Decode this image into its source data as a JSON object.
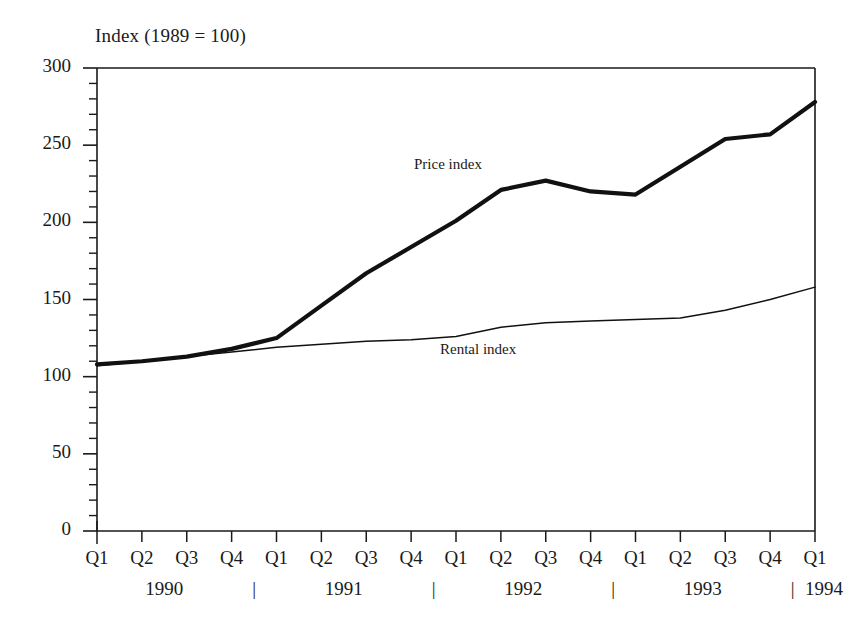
{
  "chart_data": {
    "type": "line",
    "title": "Index (1989 = 100)",
    "xlabel": "",
    "ylabel": "",
    "ylim": [
      0,
      300
    ],
    "y_ticks": [
      0,
      50,
      100,
      150,
      200,
      250,
      300
    ],
    "y_minor_step": 10,
    "grid": false,
    "legend_position": "inline-annotation",
    "categories": [
      "Q1 1990",
      "Q2 1990",
      "Q3 1990",
      "Q4 1990",
      "Q1 1991",
      "Q2 1991",
      "Q3 1991",
      "Q4 1991",
      "Q1 1992",
      "Q2 1992",
      "Q3 1992",
      "Q4 1992",
      "Q1 1993",
      "Q2 1993",
      "Q3 1993",
      "Q4 1993",
      "Q1 1994"
    ],
    "quarter_labels": [
      "Q1",
      "Q2",
      "Q3",
      "Q4",
      "Q1",
      "Q2",
      "Q3",
      "Q4",
      "Q1",
      "Q2",
      "Q3",
      "Q4",
      "Q1",
      "Q2",
      "Q3",
      "Q4",
      "Q1"
    ],
    "year_labels": [
      "1990",
      "1991",
      "1992",
      "1993",
      "1994"
    ],
    "year_separator_glyph": "|",
    "series": [
      {
        "name": "Price index",
        "values": [
          108,
          110,
          113,
          118,
          125,
          146,
          167,
          184,
          201,
          221,
          227,
          220,
          218,
          236,
          254,
          257,
          278
        ]
      },
      {
        "name": "Rental index",
        "values": [
          107,
          110,
          113,
          116,
          119,
          121,
          123,
          124,
          126,
          132,
          135,
          136,
          137,
          138,
          143,
          150,
          158
        ]
      }
    ]
  }
}
